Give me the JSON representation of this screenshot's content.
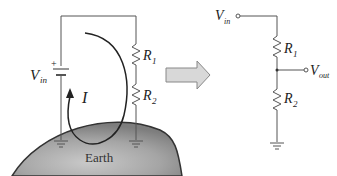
{
  "left_circuit": {
    "source_label": "V",
    "source_sub": "in",
    "plus_sign": "+",
    "current_label": "I",
    "r1_label": "R",
    "r1_sub": "1",
    "r2_label": "R",
    "r2_sub": "2",
    "earth_label": "Earth"
  },
  "right_circuit": {
    "vin_label": "V",
    "vin_sub": "in",
    "r1_label": "R",
    "r1_sub": "1",
    "r2_label": "R",
    "r2_sub": "2",
    "vout_label": "V",
    "vout_sub": "out"
  },
  "colors": {
    "wire": "#555555",
    "earth_fill": "#9a9a9a",
    "arrow_fill": "#d8d8d8",
    "arrow_stroke": "#888888"
  }
}
